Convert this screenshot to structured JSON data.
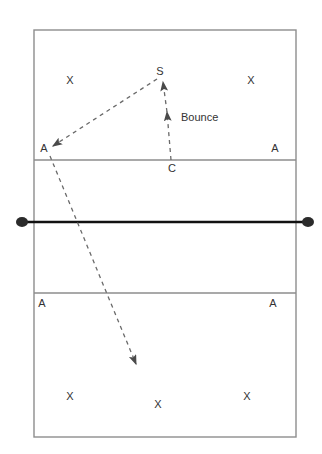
{
  "diagram": {
    "court": {
      "left": 34,
      "top": 30,
      "right": 296,
      "bottom": 437,
      "boundary_color": "#888888",
      "attack_line_top_y": 160,
      "attack_line_bottom_y": 293,
      "net_y": 222,
      "net_color": "#111111",
      "net_post_left_x": 22,
      "net_post_right_x": 308
    },
    "path_color": "#555555",
    "markers": [
      {
        "id": "x-top-left",
        "label": "X",
        "x": 70,
        "y": 84
      },
      {
        "id": "x-top-right",
        "label": "X",
        "x": 251,
        "y": 84
      },
      {
        "id": "a-upper-left",
        "label": "A",
        "x": 44,
        "y": 152
      },
      {
        "id": "a-upper-right",
        "label": "A",
        "x": 275,
        "y": 152
      },
      {
        "id": "a-lower-left",
        "label": "A",
        "x": 42,
        "y": 307
      },
      {
        "id": "a-lower-right",
        "label": "A",
        "x": 273,
        "y": 307
      },
      {
        "id": "x-bottom-left",
        "label": "X",
        "x": 70,
        "y": 400
      },
      {
        "id": "x-bottom-center",
        "label": "X",
        "x": 158,
        "y": 408
      },
      {
        "id": "x-bottom-right",
        "label": "X",
        "x": 247,
        "y": 400
      }
    ],
    "points": [
      {
        "id": "setter-point",
        "label": "S",
        "x": 160,
        "y": 75
      },
      {
        "id": "coach-point",
        "label": "C",
        "x": 172,
        "y": 172
      }
    ],
    "annotations": [
      {
        "id": "bounce-annotation",
        "label": "Bounce",
        "x": 181,
        "y": 121
      }
    ]
  }
}
